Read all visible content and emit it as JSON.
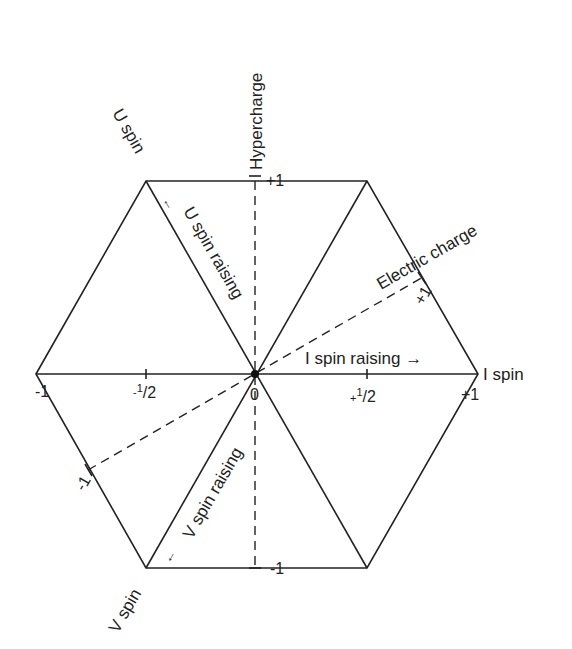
{
  "diagram": {
    "type": "weight-diagram-hexagon",
    "axes": {
      "i_spin": {
        "label": "I spin",
        "ticks": [
          "-1",
          "-1/2",
          "0",
          "+1/2",
          "+1"
        ]
      },
      "hypercharge": {
        "label": "Hypercharge",
        "ticks": [
          "+1",
          "-1"
        ]
      },
      "electric_charge": {
        "label": "Electric charge",
        "ticks": [
          "+1",
          "-1"
        ]
      }
    },
    "labels": {
      "u_spin": "U spin",
      "v_spin": "V spin",
      "i_spin": "I spin",
      "hypercharge": "Hypercharge",
      "electric_charge": "Electric charge",
      "u_spin_raising": "U spin raising",
      "v_spin_raising": "V spin raising",
      "i_spin_raising": "I spin raising →",
      "u_arrow": "←",
      "v_arrow": "←"
    },
    "ticks": {
      "x_minus_1": "-1",
      "x_minus_half_sign": "-",
      "x_minus_half_num": "1",
      "x_minus_half_den": "/2",
      "x_zero": "0",
      "x_plus_half_sign": "+",
      "x_plus_half_num": "1",
      "x_plus_half_den": "/2",
      "x_plus_1": "+1",
      "y_plus_1": "+1",
      "y_minus_1": "-1",
      "q_plus_1": "+1",
      "q_minus_1": "-1"
    },
    "colors": {
      "ink": "#222222",
      "background": "#ffffff"
    }
  }
}
